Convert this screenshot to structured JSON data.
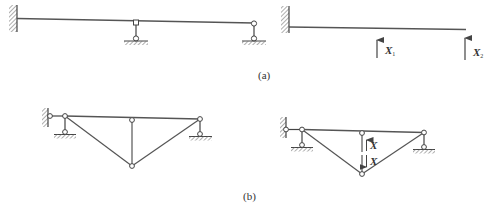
{
  "diagram": {
    "stroke_color": "#555555",
    "hatch_color": "#777777",
    "parts": [
      {
        "id": "a",
        "caption": "(a)",
        "left": {
          "description": "continuous beam fixed at left end, pinned link supports at middle and right end"
        },
        "right": {
          "description": "cantilever basic system with redundant forces",
          "forces": [
            {
              "label": "X",
              "subscript": "1"
            },
            {
              "label": "X",
              "subscript": "2"
            }
          ]
        }
      },
      {
        "id": "b",
        "caption": "(b)",
        "left": {
          "description": "trussed beam with fixed-pinned link at left, link supports at both ends, central vertical strut"
        },
        "right": {
          "description": "basic system with cut strut and pair of redundant forces",
          "forces": [
            {
              "label": "X"
            },
            {
              "label": "X"
            }
          ]
        }
      }
    ]
  }
}
